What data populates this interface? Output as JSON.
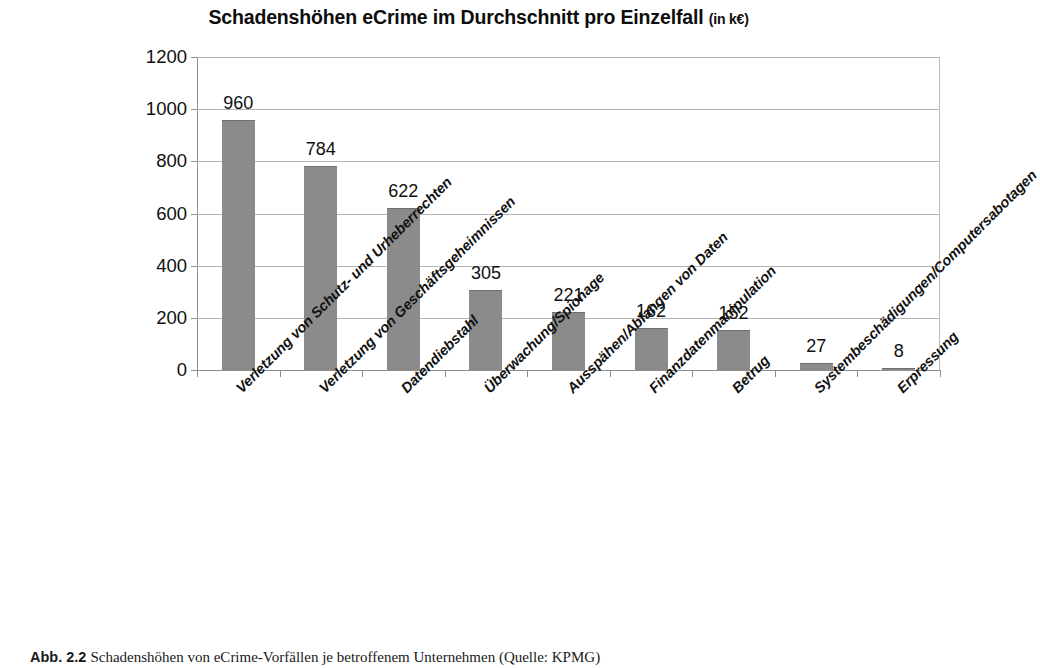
{
  "chart_data": {
    "type": "bar",
    "title": "Schadenshöhen eCrime im Durchschnitt pro Einzelfall",
    "title_unit": "(in k€)",
    "xlabel": "",
    "ylabel": "",
    "ylim": [
      0,
      1200
    ],
    "ytick_step": 200,
    "grid": true,
    "legend": "none",
    "bar_color": "#8b8b8b",
    "categories": [
      "Verletzung von Schutz- und Urheberrechten",
      "Verletzung von Geschäftsgeheimnissen",
      "Datendiebstahl",
      "Überwachung/Spionage",
      "Ausspähen/Abfangen von Daten",
      "Finanzdatenmanipulation",
      "Betrug",
      "Systembeschädigungen/Computersabotagen",
      "Erpressung"
    ],
    "values": [
      960,
      784,
      622,
      305,
      221,
      162,
      152,
      27,
      8
    ],
    "value_labels": [
      "960",
      "784",
      "622",
      "305",
      "221",
      "162",
      "152",
      "27",
      "8"
    ],
    "ytick_labels": [
      "0",
      "200",
      "400",
      "600",
      "800",
      "1000",
      "1200"
    ],
    "ytick_values": [
      0,
      200,
      400,
      600,
      800,
      1000,
      1200
    ]
  },
  "caption": {
    "number": "Abb. 2.2",
    "text": "Schadenshöhen von eCrime-Vorfällen je betroffenem Unternehmen (Quelle: KPMG)"
  }
}
